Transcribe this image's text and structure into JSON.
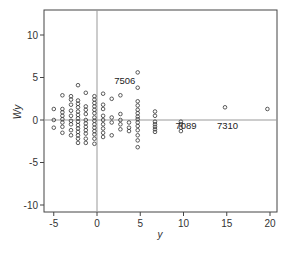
{
  "chart_data": {
    "type": "scatter",
    "title": "",
    "xlabel": "y",
    "ylabel": "Wy",
    "xlim": [
      -6.3,
      20.5
    ],
    "ylim": [
      -10.5,
      13.2
    ],
    "xticks": [
      -5,
      0,
      5,
      10,
      15,
      20
    ],
    "yticks": [
      -10,
      -5,
      0,
      5,
      10
    ],
    "grid": false,
    "legend": null,
    "reference_lines": {
      "x": 0,
      "y": 0
    },
    "marker": "open-circle",
    "annotations": [
      {
        "text": "7506",
        "x": 3.2,
        "y": 4.3
      },
      {
        "text": "7089",
        "x": 10.3,
        "y": -1.1
      },
      {
        "text": "7310",
        "x": 15.1,
        "y": -1.1
      }
    ],
    "series": [
      {
        "name": "points",
        "points": [
          [
            -5.0,
            1.3
          ],
          [
            -5.0,
            0.0
          ],
          [
            -5.0,
            -0.9
          ],
          [
            -4.0,
            2.9
          ],
          [
            -4.0,
            1.3
          ],
          [
            -4.0,
            0.9
          ],
          [
            -4.0,
            0.5
          ],
          [
            -4.0,
            0.1
          ],
          [
            -4.0,
            -0.3
          ],
          [
            -4.0,
            -0.8
          ],
          [
            -4.0,
            -1.5
          ],
          [
            -3.0,
            2.8
          ],
          [
            -3.0,
            2.4
          ],
          [
            -3.0,
            1.8
          ],
          [
            -3.0,
            1.1
          ],
          [
            -3.0,
            0.5
          ],
          [
            -3.0,
            -0.1
          ],
          [
            -3.0,
            -0.5
          ],
          [
            -3.0,
            -1.2
          ],
          [
            -3.0,
            -1.8
          ],
          [
            -2.2,
            4.1
          ],
          [
            -2.2,
            2.3
          ],
          [
            -2.2,
            1.9
          ],
          [
            -2.2,
            1.5
          ],
          [
            -2.2,
            1.0
          ],
          [
            -2.2,
            0.6
          ],
          [
            -2.2,
            0.2
          ],
          [
            -2.2,
            -0.2
          ],
          [
            -2.2,
            -0.6
          ],
          [
            -2.2,
            -1.0
          ],
          [
            -2.2,
            -1.4
          ],
          [
            -2.2,
            -1.8
          ],
          [
            -2.2,
            -2.2
          ],
          [
            -2.2,
            -2.7
          ],
          [
            -1.3,
            3.2
          ],
          [
            -1.3,
            1.6
          ],
          [
            -1.3,
            1.2
          ],
          [
            -1.3,
            0.7
          ],
          [
            -1.3,
            0.0
          ],
          [
            -1.3,
            -0.4
          ],
          [
            -1.3,
            -0.8
          ],
          [
            -1.3,
            -1.2
          ],
          [
            -1.3,
            -1.6
          ],
          [
            -1.3,
            -2.2
          ],
          [
            -1.3,
            -2.7
          ],
          [
            -0.3,
            2.8
          ],
          [
            -0.3,
            2.4
          ],
          [
            -0.3,
            2.0
          ],
          [
            -0.3,
            1.6
          ],
          [
            -0.3,
            1.2
          ],
          [
            -0.3,
            0.8
          ],
          [
            -0.3,
            0.3
          ],
          [
            -0.3,
            -0.1
          ],
          [
            -0.3,
            -0.5
          ],
          [
            -0.3,
            -0.9
          ],
          [
            -0.3,
            -1.3
          ],
          [
            -0.3,
            -1.7
          ],
          [
            -0.3,
            -2.2
          ],
          [
            -0.3,
            -2.8
          ],
          [
            0.7,
            3.1
          ],
          [
            0.7,
            1.8
          ],
          [
            0.7,
            1.3
          ],
          [
            0.7,
            0.5
          ],
          [
            0.7,
            0.0
          ],
          [
            0.7,
            -0.5
          ],
          [
            0.7,
            -1.0
          ],
          [
            0.7,
            -1.5
          ],
          [
            0.7,
            -2.0
          ],
          [
            1.7,
            2.5
          ],
          [
            1.7,
            0.3
          ],
          [
            1.7,
            -0.3
          ],
          [
            1.7,
            -1.8
          ],
          [
            2.7,
            2.9
          ],
          [
            2.7,
            0.7
          ],
          [
            2.7,
            0.0
          ],
          [
            2.7,
            -0.5
          ],
          [
            2.7,
            -1.1
          ],
          [
            3.7,
            -0.3
          ],
          [
            3.7,
            -0.9
          ],
          [
            3.7,
            -1.3
          ],
          [
            4.7,
            5.6
          ],
          [
            4.7,
            3.8
          ],
          [
            4.7,
            2.2
          ],
          [
            4.7,
            1.7
          ],
          [
            4.7,
            1.2
          ],
          [
            4.7,
            0.8
          ],
          [
            4.7,
            0.4
          ],
          [
            4.7,
            0.1
          ],
          [
            4.7,
            -0.3
          ],
          [
            4.7,
            -0.7
          ],
          [
            4.7,
            -1.2
          ],
          [
            4.7,
            -1.8
          ],
          [
            4.7,
            -2.4
          ],
          [
            4.7,
            -3.2
          ],
          [
            6.7,
            1.0
          ],
          [
            6.7,
            0.5
          ],
          [
            6.7,
            -0.2
          ],
          [
            6.7,
            -0.5
          ],
          [
            6.7,
            -0.8
          ],
          [
            6.7,
            -1.1
          ],
          [
            6.7,
            -1.4
          ],
          [
            9.7,
            -0.2
          ],
          [
            9.7,
            -0.5
          ],
          [
            9.7,
            -0.9
          ],
          [
            9.7,
            -1.3
          ],
          [
            14.8,
            1.5
          ],
          [
            19.7,
            1.3
          ]
        ]
      }
    ]
  }
}
